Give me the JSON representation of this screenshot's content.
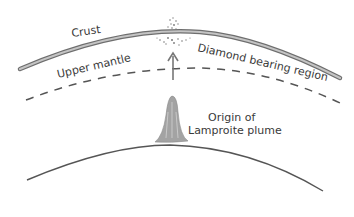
{
  "diagram": {
    "labels": {
      "crust": "Crust",
      "upper_mantle": "Upper mantle",
      "diamond_region": "Diamond bearing region",
      "origin_line1": "Origin of",
      "origin_line2": "Lamproite plume"
    },
    "colors": {
      "crust_fill": "#bdbdbd",
      "crust_edge": "#6e6e6e",
      "line": "#555555",
      "plume": "#9a9a9a",
      "text": "#3a3a3a"
    }
  }
}
